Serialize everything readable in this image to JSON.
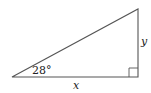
{
  "diagram": {
    "type": "right-triangle",
    "angle_label": "28°",
    "horizontal_side_label": "x",
    "vertical_side_label": "y",
    "right_angle_marker": true,
    "vertices": {
      "left": [
        12,
        77
      ],
      "right_angle": [
        138,
        77
      ],
      "top": [
        138,
        9
      ]
    },
    "stroke_color": "#555555"
  }
}
